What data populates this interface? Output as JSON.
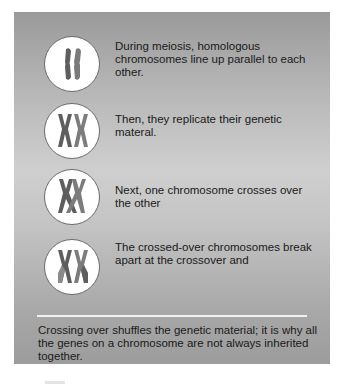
{
  "figure": {
    "steps": [
      {
        "icon": "homologous-chromosomes-parallel",
        "text": "During meiosis, homologous chromosomes line up parallel to each other."
      },
      {
        "icon": "replicated-chromosomes",
        "text": "Then, they replicate their genetic materal."
      },
      {
        "icon": "chromosomes-crossing-over",
        "text": "Next, one chromosome crosses over the other"
      },
      {
        "icon": "chromosomes-broken-at-crossover",
        "text": "The crossed-over chromosomes break apart at the crossover and"
      }
    ],
    "summary": "Crossing over shuffles the genetic material; it is why all the genes on a chromosome are not always inherited together."
  },
  "colors": {
    "panel_top": "#9a9a9a",
    "panel_mid": "#cfcfcf",
    "chromosome_dark": "#5e5e5e",
    "chromosome_light": "#8a8a8a",
    "circle_fill": "#ffffff"
  }
}
